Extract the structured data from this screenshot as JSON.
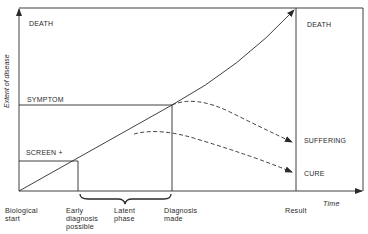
{
  "diagram": {
    "y_axis_label": "Extent of disease",
    "x_axis_label": "Time",
    "left_levels": {
      "death": "DEATH",
      "symptom": "SYMPTOM",
      "screen": "SCREEN +"
    },
    "outcomes": {
      "death": "DEATH",
      "suffering": "SUFFERING",
      "cure": "CURE"
    },
    "time_points": {
      "biological_start": [
        "Biological",
        "start"
      ],
      "early_diagnosis": [
        "Early",
        "diagnosis",
        "possible"
      ],
      "latent_phase": [
        "Latent",
        "phase"
      ],
      "diagnosis_made": [
        "Diagnosis",
        "made"
      ],
      "result": "Result"
    },
    "colors": {
      "line": "#2a2a2a",
      "background": "#ffffff"
    }
  }
}
